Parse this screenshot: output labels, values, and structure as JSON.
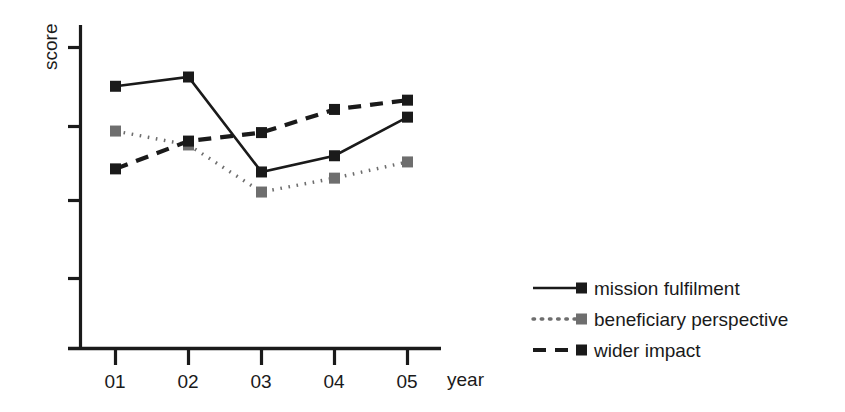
{
  "chart_data": {
    "type": "line",
    "title": "",
    "xlabel": "year",
    "ylabel": "score",
    "categories": [
      "01",
      "02",
      "03",
      "04",
      "05"
    ],
    "x_tick_labels": [
      "01",
      "02",
      "03",
      "04",
      "05"
    ],
    "y_tick_labels": [
      "",
      "",
      "",
      ""
    ],
    "xlim": [
      0.5,
      5.5
    ],
    "ylim": [
      0,
      4.4
    ],
    "grid": false,
    "legend_position": "right-bottom",
    "series": [
      {
        "name": "mission fulfilment",
        "linestyle": "solid",
        "marker": "square",
        "color": "#1a1a1a",
        "marker_color": "#1a1a1a",
        "values": [
          3.49,
          3.61,
          2.38,
          2.59,
          3.09
        ]
      },
      {
        "name": "beneficiary perspective",
        "linestyle": "dotted",
        "marker": "square",
        "color": "#6e6e6e",
        "marker_color": "#6e6e6e",
        "values": [
          2.91,
          2.73,
          2.12,
          2.3,
          2.51
        ]
      },
      {
        "name": "wider impact",
        "linestyle": "dashed",
        "marker": "square",
        "color": "#1a1a1a",
        "marker_color": "#1a1a1a",
        "values": [
          2.42,
          2.78,
          2.89,
          3.19,
          3.31
        ]
      }
    ]
  },
  "axes": {
    "y_label": "score",
    "x_label": "year"
  },
  "legend": {
    "entries": [
      {
        "label": "mission fulfilment",
        "style": "solid",
        "swatch_color": "#1a1a1a"
      },
      {
        "label": "beneficiary perspective",
        "style": "dotted",
        "swatch_color": "#6e6e6e"
      },
      {
        "label": "wider impact",
        "style": "dashed",
        "swatch_color": "#1a1a1a"
      }
    ]
  },
  "colors": {
    "axis": "#1a1a1a",
    "solid_series": "#1a1a1a",
    "dotted_series": "#6e6e6e",
    "dashed_series": "#1a1a1a",
    "background": "#ffffff"
  }
}
